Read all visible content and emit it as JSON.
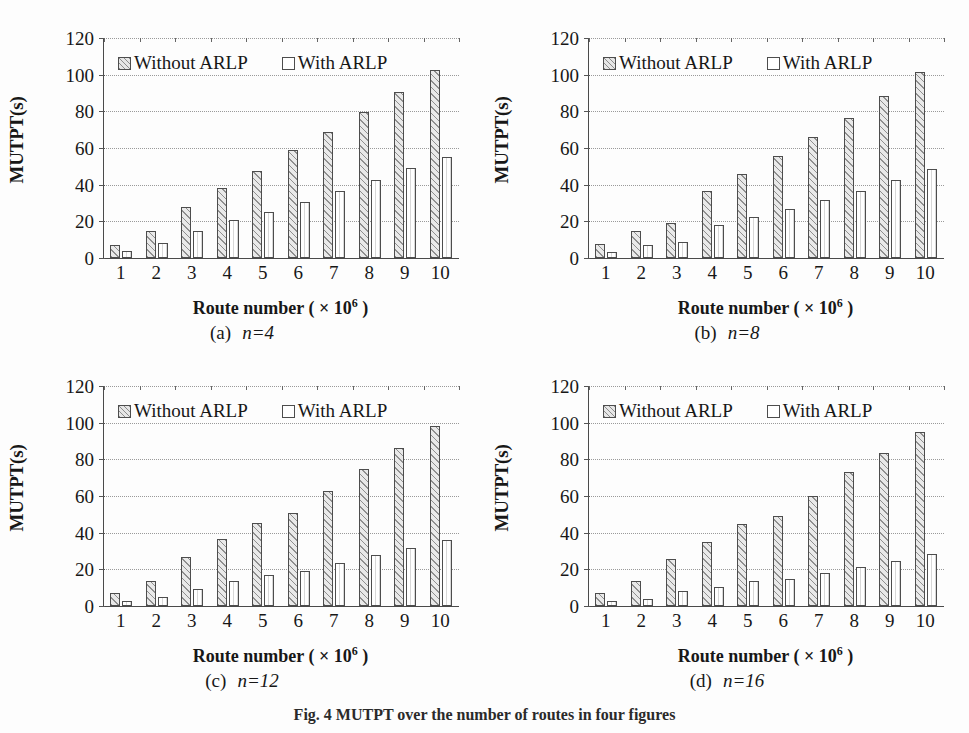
{
  "figure": {
    "caption": "Fig. 4  MUTPT over the number of routes in four figures",
    "axis": {
      "ylabel": "MUTPT(s)",
      "yticks": [
        0,
        20,
        40,
        60,
        80,
        100,
        120
      ],
      "ylim": [
        0,
        120
      ],
      "xlabel_text": "Route number  (  × 10",
      "xlabel_exp": "6",
      "xlabel_close": " )",
      "xticks": [
        "1",
        "2",
        "3",
        "4",
        "5",
        "6",
        "7",
        "8",
        "9",
        "10"
      ]
    },
    "legend": [
      {
        "label": "Without ARLP",
        "swatch": "diagonal-hatch-swatch"
      },
      {
        "label": "With ARLP",
        "swatch": "open-square-swatch"
      }
    ],
    "colors": {
      "axis": "#4a4a4a",
      "grid": "#9a9a9a",
      "hatch": "#8f8f8f",
      "bar_fill_without": "#e9e9e9",
      "bar_fill_with": "#ffffff",
      "text": "#171717"
    },
    "panels": [
      {
        "tag": "(a)",
        "n_label": "n=4",
        "caption": "(a)   n=4"
      },
      {
        "tag": "(b)",
        "n_label": "n=8",
        "caption": "(b)   n=8"
      },
      {
        "tag": "(c)",
        "n_label": "n=12",
        "caption": "(c)   n=12"
      },
      {
        "tag": "(d)",
        "n_label": "n=16",
        "caption": "(d)   n=16"
      }
    ]
  },
  "chart_data": [
    {
      "type": "bar",
      "title": "(a)  n=4",
      "xlabel": "Route number ( ×10⁶ )",
      "ylabel": "MUTPT(s)",
      "ylim": [
        0,
        120
      ],
      "grid": true,
      "legend_position": "top-inside",
      "categories": [
        "1",
        "2",
        "3",
        "4",
        "5",
        "6",
        "7",
        "8",
        "9",
        "10"
      ],
      "series": [
        {
          "name": "Without ARLP",
          "values": [
            7,
            15,
            28,
            38,
            47.5,
            59,
            68.5,
            79.5,
            90.5,
            102.5
          ]
        },
        {
          "name": "With ARLP",
          "values": [
            4,
            8,
            14.5,
            20.5,
            25,
            30.5,
            36.5,
            42.5,
            49,
            55
          ]
        }
      ]
    },
    {
      "type": "bar",
      "title": "(b)  n=8",
      "xlabel": "Route number ( ×10⁶ )",
      "ylabel": "MUTPT(s)",
      "ylim": [
        0,
        120
      ],
      "grid": true,
      "legend_position": "top-inside",
      "categories": [
        "1",
        "2",
        "3",
        "4",
        "5",
        "6",
        "7",
        "8",
        "9",
        "10"
      ],
      "series": [
        {
          "name": "Without ARLP",
          "values": [
            7.5,
            14.5,
            19,
            36.5,
            46,
            55.5,
            66,
            76.5,
            88.5,
            101.5
          ]
        },
        {
          "name": "With ARLP",
          "values": [
            3.5,
            7,
            8.5,
            18,
            22.5,
            26.5,
            31.5,
            36.5,
            42.5,
            48.5
          ]
        }
      ]
    },
    {
      "type": "bar",
      "title": "(c)  n=12",
      "xlabel": "Route number ( ×10⁶ )",
      "ylabel": "MUTPT(s)",
      "ylim": [
        0,
        120
      ],
      "grid": true,
      "legend_position": "top-inside",
      "categories": [
        "1",
        "2",
        "3",
        "4",
        "5",
        "6",
        "7",
        "8",
        "9",
        "10"
      ],
      "series": [
        {
          "name": "Without ARLP",
          "values": [
            7,
            13.5,
            27,
            36.5,
            45.5,
            51,
            63,
            75,
            86,
            98
          ]
        },
        {
          "name": "With ARLP",
          "values": [
            2.5,
            5,
            9.5,
            13.5,
            17,
            19,
            23.5,
            28,
            31.5,
            36
          ]
        }
      ]
    },
    {
      "type": "bar",
      "title": "(d)  n=16",
      "xlabel": "Route number ( ×10⁶ )",
      "ylabel": "MUTPT(s)",
      "ylim": [
        0,
        120
      ],
      "grid": true,
      "legend_position": "top-inside",
      "categories": [
        "1",
        "2",
        "3",
        "4",
        "5",
        "6",
        "7",
        "8",
        "9",
        "10"
      ],
      "series": [
        {
          "name": "Without ARLP",
          "values": [
            7,
            13.5,
            25.5,
            35,
            44.5,
            49,
            60,
            73,
            83.5,
            95
          ]
        },
        {
          "name": "With ARLP",
          "values": [
            2.5,
            4,
            8,
            10.5,
            13.5,
            14.5,
            18,
            21.5,
            24.5,
            28.5
          ]
        }
      ]
    }
  ]
}
